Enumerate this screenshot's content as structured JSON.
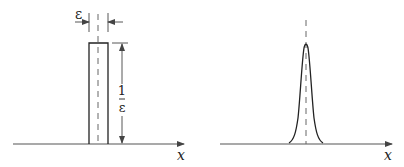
{
  "figure": {
    "left_panel": {
      "title": "",
      "width_label": "ε",
      "height_label_numerator": "1",
      "height_label_denominator": "ε",
      "x_axis_label": "x",
      "shape": "rectangle pulse"
    },
    "right_panel": {
      "title": "",
      "x_axis_label": "x",
      "shape": "narrow peaked bell curve"
    },
    "colors": {
      "line": "#222222",
      "axis": "#555555",
      "dashed": "#666666",
      "background": "#ffffff"
    }
  }
}
